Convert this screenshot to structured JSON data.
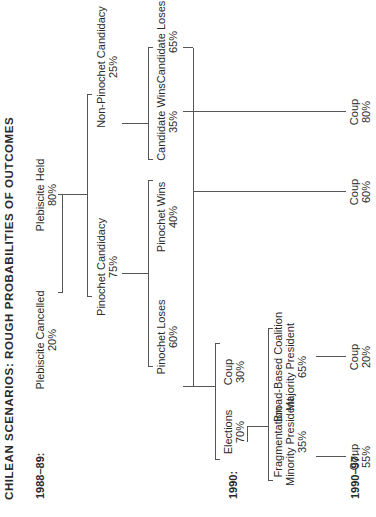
{
  "title": "CHILEAN SCENARIOS: ROUGH PROBABILITIES OF OUTCOMES",
  "periods": {
    "p1": "1988–89:",
    "p2": "1990:",
    "p3": "1990–97:"
  },
  "nodes": {
    "plebiscite_cancelled": {
      "label": "Plebiscite Cancelled",
      "pct": "20%"
    },
    "plebiscite_held": {
      "label": "Plebiscite Held",
      "pct": "80%"
    },
    "pinochet_candidacy": {
      "label": "Pinochet Candidacy",
      "pct": "75%"
    },
    "non_pinochet_candidacy": {
      "label": "Non-Pinochet Candidacy",
      "pct": "25%"
    },
    "pinochet_loses": {
      "label": "Pinochet Loses",
      "pct": "60%"
    },
    "pinochet_wins": {
      "label": "Pinochet Wins",
      "pct": "40%"
    },
    "candidate_wins": {
      "label": "Candidate Wins",
      "pct": "35%"
    },
    "candidate_loses": {
      "label": "Candidate Loses",
      "pct": "65%"
    },
    "elections": {
      "label": "Elections",
      "pct": "70%"
    },
    "coup_1990": {
      "label": "Coup",
      "pct": "30%"
    },
    "fragmentation": {
      "label1": "Fragmentation",
      "label2": "Minority President",
      "pct": "35%"
    },
    "broad_coalition": {
      "label1": "Broad-Based Coalition",
      "label2": "Majority President",
      "pct": "65%"
    },
    "coup_frag": {
      "label": "Coup",
      "pct": "55%"
    },
    "coup_broad": {
      "label": "Coup",
      "pct": "20%"
    },
    "coup_pinochet_wins": {
      "label": "Coup",
      "pct": "60%"
    },
    "coup_candidate_wins": {
      "label": "Coup",
      "pct": "80%"
    }
  }
}
